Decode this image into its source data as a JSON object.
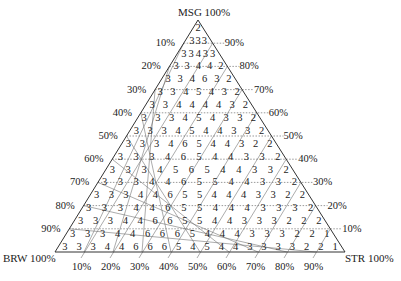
{
  "diagram": {
    "type": "ternary",
    "vertices": {
      "top": "MSG 100%",
      "left": "BRW 100%",
      "right": "STR 100%"
    },
    "left_axis_ticks": [
      "10%",
      "20%",
      "30%",
      "40%",
      "50%",
      "60%",
      "70%",
      "80%",
      "90%"
    ],
    "right_axis_ticks": [
      "90%",
      "80%",
      "70%",
      "60%",
      "50%",
      "40%",
      "30%",
      "20%",
      "10%"
    ],
    "bottom_axis_ticks": [
      "10%",
      "20%",
      "30%",
      "40%",
      "50%",
      "60%",
      "70%",
      "80%",
      "90%"
    ],
    "rows": [
      [
        "2"
      ],
      [
        "3",
        "3",
        "3"
      ],
      [
        "3",
        "3",
        "4",
        "3",
        "3"
      ],
      [
        "3",
        "3",
        "4",
        "4",
        "3",
        "2",
        "2"
      ],
      [
        "3",
        "3",
        "4",
        "6",
        "3",
        "3",
        "2",
        "2",
        "2"
      ],
      [
        "3",
        "3",
        "4",
        "5",
        "4",
        "4",
        "3",
        "3",
        "2",
        "2",
        "2"
      ],
      [
        "3",
        "3",
        "4",
        "4",
        "4",
        "4",
        "4",
        "3",
        "3",
        "2",
        "2",
        "2",
        "2"
      ],
      [
        "3",
        "3",
        "3",
        "4",
        "5",
        "4",
        "4",
        "3",
        "3",
        "3",
        "2",
        "2",
        "2",
        "2",
        "2"
      ],
      [
        "3",
        "3",
        "3",
        "4",
        "5",
        "4",
        "4",
        "4",
        "3",
        "3",
        "3",
        "3",
        "2",
        "2",
        "2",
        "2",
        "2"
      ],
      [
        "3",
        "3",
        "3",
        "4",
        "6",
        "5",
        "5",
        "4",
        "4",
        "4",
        "3",
        "3",
        "3",
        "2",
        "2",
        "2",
        "2",
        "2",
        "2"
      ],
      [
        "3",
        "3",
        "3",
        "4",
        "6",
        "6",
        "5",
        "4",
        "4",
        "4",
        "4",
        "3",
        "3",
        "3",
        "2",
        "2",
        "2",
        "2",
        "2",
        "2",
        "2"
      ],
      [
        "3",
        "3",
        "3",
        "4",
        "4",
        "5",
        "6",
        "5",
        "5",
        "4",
        "4",
        "4",
        "3",
        "3",
        "3",
        "3",
        "2",
        "2",
        "2",
        "2",
        "2",
        "2",
        "2"
      ],
      [
        "3",
        "3",
        "3",
        "4",
        "4",
        "6",
        "5",
        "5",
        "5",
        "5",
        "4",
        "4",
        "4",
        "3",
        "3",
        "3",
        "3",
        "2",
        "2",
        "2",
        "2",
        "2",
        "2",
        "2",
        "2"
      ],
      [
        "3",
        "3",
        "3",
        "4",
        "4",
        "6",
        "5",
        "5",
        "5",
        "5",
        "4",
        "4",
        "4",
        "4",
        "3",
        "3",
        "3",
        "3",
        "2",
        "2",
        "2",
        "2",
        "2",
        "2",
        "2",
        "2",
        "2"
      ],
      [
        "3",
        "3",
        "3",
        "4",
        "4",
        "6",
        "6",
        "5",
        "5",
        "4",
        "4",
        "4",
        "4",
        "4",
        "3",
        "3",
        "3",
        "3",
        "3",
        "2",
        "2",
        "2",
        "2",
        "2",
        "2",
        "2",
        "2",
        "2",
        "2"
      ],
      [
        "3",
        "3",
        "3",
        "4",
        "4",
        "6",
        "6",
        "6",
        "5",
        "4",
        "4",
        "4",
        "4",
        "4",
        "3",
        "3",
        "3",
        "3",
        "3",
        "3",
        "2",
        "2",
        "2",
        "2",
        "2",
        "1",
        "1",
        "1",
        "1",
        "1",
        "1"
      ],
      [
        "3",
        "3",
        "3",
        "4",
        "4",
        "6",
        "6",
        "6",
        "5",
        "4",
        "5",
        "4",
        "4",
        "3",
        "3",
        "3",
        "3",
        "3",
        "3",
        "2",
        "2",
        "2",
        "2",
        "1",
        "1",
        "1",
        "1",
        "1",
        "1",
        "1",
        "1",
        "1",
        "1"
      ]
    ],
    "row_text": [
      "2",
      "3 3 3",
      "3 3 4 3 3",
      "3 3 4 4 2",
      "3 3 4 6 3 2",
      "3 3 4 5 4 3 2",
      "3 3 4 4 4 4 3 2",
      "3 3 3 4 5 4 3 3 2",
      "3 3 3 4 5 4 4 3 3 2",
      "3 3 3 4 6 5 4 4 3 2 2",
      "3 3 3 4 6 5 4 4 3 3 2",
      "3 3 3 4 5 6 5 4 4 3 3 2",
      "3 3 3 4 4 6 5 5 4 4 3 3 2",
      "3 3 3 4 4 6 5 5 4 4 4 3 3 2 2",
      "3 3 3 4 4 6 5 5 4 4 4 3 3 3 2",
      "3 3 3 4 4 6 6 5 5 4 4 3 3 3 2 2 2",
      "3 3 3 4 4 6 6 6 5 4 4 4 3 3 3 2 2 1",
      "3 3 3 4 4 6 6 6 5 4 5 4 4 3 3 3 3 2 2 1"
    ]
  }
}
